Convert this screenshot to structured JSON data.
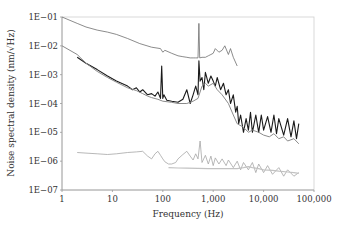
{
  "chart_data": {
    "type": "line",
    "title": "",
    "xlabel": "Frequency (Hz)",
    "ylabel": "Noise spectral density (nm/√Hz)",
    "xscale": "log",
    "yscale": "log",
    "xlim": [
      1,
      100000
    ],
    "ylim": [
      1e-07,
      0.1
    ],
    "grid": false,
    "legend": "none",
    "x_ticks": [
      {
        "value": 1,
        "label": "1"
      },
      {
        "value": 10,
        "label": "10"
      },
      {
        "value": 100,
        "label": "100"
      },
      {
        "value": 1000,
        "label": "1,000"
      },
      {
        "value": 10000,
        "label": "10,000"
      },
      {
        "value": 100000,
        "label": "100,000"
      }
    ],
    "y_ticks": [
      {
        "value": 0.1,
        "label": "1E−01"
      },
      {
        "value": 0.01,
        "label": "1E−02"
      },
      {
        "value": 0.001,
        "label": "1E−03"
      },
      {
        "value": 0.0001,
        "label": "1E−04"
      },
      {
        "value": 1e-05,
        "label": "1E−05"
      },
      {
        "value": 1e-06,
        "label": "1E−06"
      },
      {
        "value": 1e-07,
        "label": "1E−07"
      }
    ],
    "series": [
      {
        "name": "upper-thin",
        "color": "#6e6e6e",
        "x": [
          1,
          2,
          3,
          5,
          8,
          12,
          20,
          35,
          60,
          90,
          100,
          110,
          150,
          200,
          250,
          300,
          350,
          400,
          450,
          500,
          520,
          540,
          600,
          700,
          800,
          900,
          1000,
          1100,
          1300,
          1500,
          1700,
          2000,
          2200,
          2500,
          3000
        ],
        "y": [
          0.1,
          0.06,
          0.045,
          0.035,
          0.03,
          0.025,
          0.018,
          0.012,
          0.009,
          0.008,
          0.006,
          0.007,
          0.0055,
          0.0045,
          0.0042,
          0.004,
          0.0038,
          0.0038,
          0.0038,
          0.0038,
          0.06,
          0.0038,
          0.004,
          0.004,
          0.0045,
          0.005,
          0.0055,
          0.008,
          0.006,
          0.007,
          0.01,
          0.005,
          0.008,
          0.004,
          0.002
        ]
      },
      {
        "name": "black-main",
        "color": "#1a1a1a",
        "x": [
          2,
          3,
          5,
          8,
          12,
          20,
          25,
          30,
          35,
          40,
          50,
          60,
          70,
          80,
          90,
          95,
          100,
          105,
          120,
          150,
          200,
          250,
          300,
          350,
          400,
          450,
          500,
          520,
          550,
          600,
          650,
          700,
          800,
          900,
          1000,
          1100,
          1200,
          1400,
          1600,
          1800,
          2000,
          2200,
          2500,
          2800,
          3000,
          3200,
          3500,
          4000,
          4500,
          5000,
          5500,
          6000,
          7000,
          8000,
          9000,
          10000,
          12000,
          14000,
          16000,
          18000,
          20000,
          25000,
          30000,
          35000,
          40000,
          45000,
          50000
        ],
        "y": [
          0.004,
          0.0025,
          0.0015,
          0.0009,
          0.0006,
          0.0004,
          0.0003,
          0.00035,
          0.00025,
          0.0003,
          0.0002,
          0.00022,
          0.00018,
          0.00025,
          0.00015,
          0.002,
          0.00015,
          0.0002,
          0.00013,
          0.00012,
          0.00011,
          0.00014,
          0.0003,
          0.0001,
          0.0002,
          0.0004,
          0.0002,
          0.003,
          0.0006,
          0.0008,
          0.0003,
          0.0012,
          0.0005,
          0.0009,
          0.0006,
          0.0004,
          0.0008,
          0.0003,
          0.0005,
          0.0002,
          0.0003,
          0.0001,
          0.0002,
          5e-05,
          8e-05,
          2e-05,
          4e-05,
          1e-05,
          3e-05,
          1.2e-05,
          5e-05,
          1e-05,
          4e-05,
          1e-05,
          4e-05,
          1.2e-05,
          3.5e-05,
          1e-05,
          4e-05,
          9e-06,
          3e-05,
          8e-06,
          3e-05,
          7e-06,
          2.5e-05,
          6e-06,
          2e-05
        ]
      },
      {
        "name": "gray-main",
        "color": "#8a8a8a",
        "x": [
          1,
          2,
          3,
          5,
          8,
          12,
          20,
          30,
          40,
          50,
          60,
          80,
          100,
          150,
          200,
          300,
          400,
          500,
          600,
          700,
          800,
          1000,
          1200,
          1500,
          2000,
          2500,
          3000,
          4000,
          5000,
          6000,
          8000,
          10000,
          13000,
          16000,
          20000,
          25000,
          30000,
          40000,
          50000
        ],
        "y": [
          0.01,
          0.005,
          0.0025,
          0.0013,
          0.0008,
          0.00055,
          0.00035,
          0.00028,
          0.00022,
          0.00018,
          0.00016,
          0.00014,
          0.00012,
          0.00011,
          0.0001,
          0.0001,
          0.00012,
          0.00015,
          0.0004,
          0.0005,
          0.0004,
          0.0005,
          0.0003,
          0.0002,
          0.0001,
          4e-05,
          2e-05,
          1.5e-05,
          1e-05,
          1.2e-05,
          1e-05,
          8e-06,
          7e-06,
          9e-06,
          6e-06,
          7e-06,
          5e-06,
          6e-06,
          4e-06
        ]
      },
      {
        "name": "light-noise",
        "color": "#a6a6a6",
        "x": [
          2,
          3,
          5,
          8,
          12,
          20,
          30,
          40,
          50,
          60,
          70,
          80,
          90,
          100,
          110,
          130,
          150,
          180,
          200,
          250,
          300,
          350,
          400,
          450,
          500,
          550,
          600,
          700,
          800,
          900,
          1000,
          1100,
          1300,
          1500,
          1800,
          2000,
          2500,
          3000,
          3500,
          4000,
          5000,
          6000,
          7000,
          8000,
          10000,
          12000,
          15000,
          20000,
          25000,
          30000,
          40000,
          50000
        ],
        "y": [
          2e-06,
          1.9e-06,
          1.8e-06,
          1.7e-06,
          1.8e-06,
          2e-06,
          2.1e-06,
          2.2e-06,
          1.5e-06,
          1.2e-06,
          1.8e-06,
          2.2e-06,
          1.6e-06,
          1.2e-06,
          9.5e-07,
          8e-07,
          8e-07,
          9e-07,
          1.2e-06,
          1.7e-06,
          2.2e-06,
          1.5e-06,
          1.1e-06,
          1.8e-06,
          1.2e-06,
          5e-06,
          9e-07,
          1.6e-06,
          8e-07,
          1.5e-06,
          7e-07,
          1.3e-06,
          8e-07,
          1.2e-06,
          7e-07,
          1.1e-06,
          6e-07,
          1e-06,
          5e-07,
          9e-07,
          5e-07,
          9e-07,
          4e-07,
          8e-07,
          4e-07,
          7e-07,
          3.5e-07,
          6e-07,
          3e-07,
          5e-07,
          3e-07,
          4e-07
        ]
      },
      {
        "name": "lightest-floor",
        "color": "#c2c2c2",
        "x": [
          130,
          200,
          300,
          500,
          800,
          1000,
          1500,
          2000,
          3000,
          4000,
          5000,
          6000,
          8000,
          10000,
          15000,
          20000,
          30000,
          40000,
          50000
        ],
        "y": [
          6e-07,
          5.8e-07,
          5.7e-07,
          5.6e-07,
          5.5e-07,
          5.5e-07,
          5.5e-07,
          5.5e-07,
          5.5e-07,
          6e-07,
          6.5e-07,
          6e-07,
          5.5e-07,
          5e-07,
          4.8e-07,
          4.5e-07,
          4.2e-07,
          4e-07,
          3.8e-07
        ]
      }
    ]
  }
}
